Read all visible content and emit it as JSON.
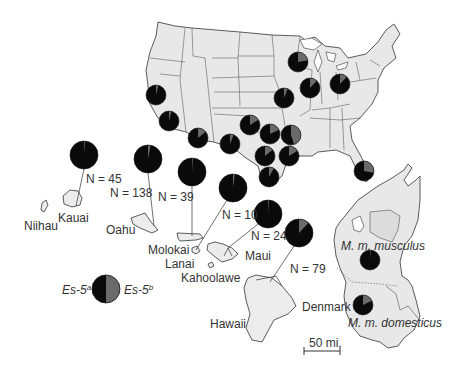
{
  "chart_data": {
    "type": "map-pie",
    "title": "",
    "legend": {
      "allele_a_label": "Es-5",
      "allele_a_sup": "a",
      "allele_b_label": "Es-5",
      "allele_b_sup": "b",
      "allele_a_color": "#0a0a0a",
      "allele_b_color": "#6a6a6a"
    },
    "us_mainland_pies": [
      {
        "name": "Wisconsin/Chicago",
        "x": 298,
        "y": 62,
        "r": 10,
        "frac_b": 0.22
      },
      {
        "name": "Illinois",
        "x": 310,
        "y": 88,
        "r": 10,
        "frac_b": 0.12
      },
      {
        "name": "Ohio",
        "x": 340,
        "y": 84,
        "r": 10,
        "frac_b": 0.12
      },
      {
        "name": "Missouri",
        "x": 284,
        "y": 98,
        "r": 10,
        "frac_b": 0.06
      },
      {
        "name": "N. California",
        "x": 156,
        "y": 95,
        "r": 10,
        "frac_b": 0.04
      },
      {
        "name": "S. California",
        "x": 169,
        "y": 121,
        "r": 10,
        "frac_b": 0.04
      },
      {
        "name": "Arizona",
        "x": 198,
        "y": 138,
        "r": 10,
        "frac_b": 0.14
      },
      {
        "name": "W. Texas",
        "x": 230,
        "y": 144,
        "r": 10,
        "frac_b": 0.06
      },
      {
        "name": "Oklahoma",
        "x": 250,
        "y": 125,
        "r": 10,
        "frac_b": 0.16
      },
      {
        "name": "N. Texas",
        "x": 270,
        "y": 134,
        "r": 10,
        "frac_b": 0.18
      },
      {
        "name": "Arkansas",
        "x": 291,
        "y": 135,
        "r": 10,
        "frac_b": 0.45
      },
      {
        "name": "C. Texas",
        "x": 265,
        "y": 156,
        "r": 10,
        "frac_b": 0.14
      },
      {
        "name": "Louisiana",
        "x": 289,
        "y": 156,
        "r": 10,
        "frac_b": 0.16
      },
      {
        "name": "S. Texas",
        "x": 269,
        "y": 177,
        "r": 10,
        "frac_b": 0.08
      },
      {
        "name": "Florida",
        "x": 364,
        "y": 171,
        "r": 10,
        "frac_b": 0.28
      }
    ],
    "hawaii_pies": [
      {
        "island": "Kauai",
        "n_label": "N = 45",
        "x": 84,
        "y": 155,
        "r": 14,
        "frac_b": 0.01
      },
      {
        "island": "Oahu",
        "n_label": "N = 138",
        "x": 148,
        "y": 159,
        "r": 14,
        "frac_b": 0.03
      },
      {
        "island": "Molokai",
        "n_label": "N = 39",
        "x": 192,
        "y": 172,
        "r": 14,
        "frac_b": 0.01
      },
      {
        "island": "Lanai",
        "n_label": "N = 10",
        "x": 233,
        "y": 188,
        "r": 14,
        "frac_b": 0.02
      },
      {
        "island": "Maui",
        "n_label": "N = 24",
        "x": 268,
        "y": 214,
        "r": 14,
        "frac_b": 0.01
      },
      {
        "island": "Hawaii",
        "n_label": "N = 79",
        "x": 299,
        "y": 233,
        "r": 14,
        "frac_b": 0.12
      }
    ],
    "denmark_pies": [
      {
        "subspecies": "M. m. musculus",
        "x": 370,
        "y": 260,
        "r": 10,
        "frac_b": 0.01
      },
      {
        "subspecies": "M. m. domesticus",
        "x": 363,
        "y": 305,
        "r": 10,
        "frac_b": 0.18
      }
    ]
  },
  "labels": {
    "niihau": "Niihau",
    "kauai": "Kauai",
    "oahu": "Oahu",
    "molokai": "Molokai",
    "lanai": "Lanai",
    "kahoolawe": "Kahoolawe",
    "maui": "Maui",
    "hawaii": "Hawaii",
    "denmark": "Denmark",
    "musculus": "M. m. musculus",
    "domesticus": "M. m. domesticus",
    "scale": "50 mi."
  },
  "n_labels": {
    "kauai": "N = 45",
    "oahu": "N = 138",
    "molokai": "N = 39",
    "lanai": "N = 10",
    "maui": "N = 24",
    "hawaii": "N = 79"
  },
  "legend": {
    "a_base": "Es-5",
    "a_sup": "a",
    "b_base": "Es-5",
    "b_sup": "b"
  }
}
